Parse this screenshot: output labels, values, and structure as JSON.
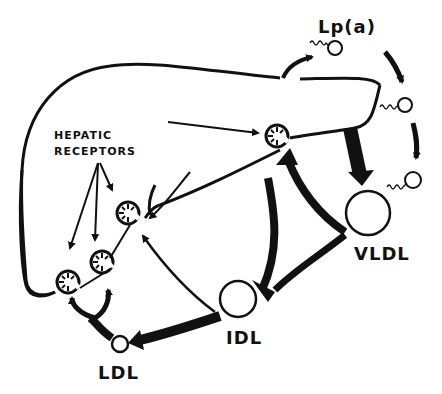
{
  "diagram": {
    "labels": {
      "lpa": "Lp(a)",
      "hepatic_line1": "HEPATIC",
      "hepatic_line2": "RECEPTORS",
      "vldl": "VLDL",
      "idl": "IDL",
      "ldl": "LDL"
    },
    "nodes": [
      "Liver",
      "Hepatic receptors (x4)",
      "Lp(a)",
      "VLDL",
      "IDL",
      "LDL"
    ],
    "edges": [
      {
        "from": "Liver",
        "to": "Lp(a)"
      },
      {
        "from": "Lp(a)",
        "to": "VLDL",
        "style": "dashed-arrow-chain"
      },
      {
        "from": "Liver",
        "to": "VLDL"
      },
      {
        "from": "VLDL",
        "to": "IDL"
      },
      {
        "from": "VLDL",
        "to": "Hepatic receptor"
      },
      {
        "from": "IDL",
        "to": "LDL"
      },
      {
        "from": "IDL",
        "to": "Hepatic receptor"
      },
      {
        "from": "LDL",
        "to": "Hepatic receptors"
      }
    ],
    "colors": {
      "ink": "#111111",
      "background": "#ffffff"
    }
  }
}
